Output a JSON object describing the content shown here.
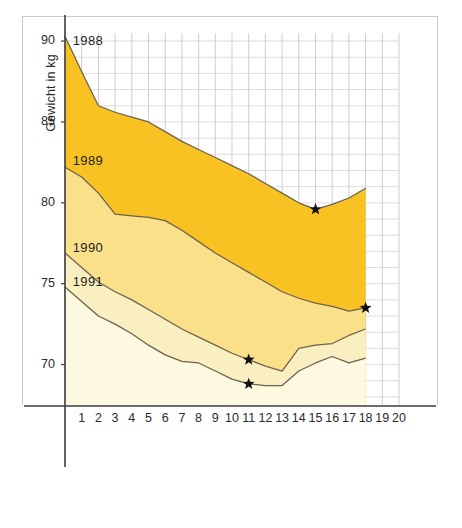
{
  "chart_data": {
    "type": "area",
    "title": "",
    "xlabel": "Fastentage",
    "ylabel": "Gewicht in kg",
    "xlim": [
      0,
      20
    ],
    "ylim": [
      67.5,
      90.5
    ],
    "grid": true,
    "grid_step_x": 1,
    "grid_step_y": 1,
    "legend_position": "inline-labels",
    "x": [
      0,
      1,
      2,
      3,
      4,
      5,
      6,
      7,
      8,
      9,
      10,
      11,
      12,
      13,
      14,
      15,
      16,
      17,
      18
    ],
    "y_ticks": [
      70,
      75,
      80,
      85,
      90
    ],
    "x_ticks": [
      1,
      2,
      3,
      4,
      5,
      6,
      7,
      8,
      9,
      10,
      11,
      12,
      13,
      14,
      15,
      16,
      17,
      18,
      19,
      20
    ],
    "series": [
      {
        "name": "1988",
        "color": "#F8C322",
        "label_x": 0.35,
        "label_y": 90.0,
        "values": [
          90.3,
          88.1,
          86.0,
          85.6,
          85.3,
          85.0,
          84.4,
          83.8,
          83.3,
          82.8,
          82.3,
          81.8,
          81.2,
          80.6,
          80.0,
          79.6,
          79.9,
          80.3,
          80.9
        ],
        "marker": {
          "x": 15,
          "y": 79.6,
          "shape": "star"
        }
      },
      {
        "name": "1989",
        "color": "#FBE08A",
        "label_x": 0.35,
        "label_y": 82.6,
        "values": [
          82.2,
          81.6,
          80.6,
          79.3,
          79.2,
          79.1,
          78.9,
          78.3,
          77.6,
          76.9,
          76.3,
          75.7,
          75.1,
          74.5,
          74.1,
          73.8,
          73.6,
          73.3,
          73.5
        ],
        "marker": {
          "x": 18,
          "y": 73.5,
          "shape": "star"
        }
      },
      {
        "name": "1990",
        "color": "#FAEFC0",
        "label_x": 0.35,
        "label_y": 77.2,
        "values": [
          76.9,
          76.0,
          75.1,
          74.5,
          74.0,
          73.4,
          72.8,
          72.2,
          71.7,
          71.2,
          70.7,
          70.3,
          69.9,
          69.6,
          71.0,
          71.2,
          71.3,
          71.8,
          72.2
        ],
        "marker": {
          "x": 11,
          "y": 70.3,
          "shape": "star"
        }
      },
      {
        "name": "1991",
        "color": "#FDF8E0",
        "label_x": 0.35,
        "label_y": 75.1,
        "values": [
          74.8,
          73.9,
          73.0,
          72.5,
          71.9,
          71.2,
          70.6,
          70.2,
          70.1,
          69.6,
          69.1,
          68.8,
          68.7,
          68.7,
          69.6,
          70.1,
          70.5,
          70.1,
          70.4
        ],
        "marker": {
          "x": 11,
          "y": 68.8,
          "shape": "star"
        }
      }
    ]
  },
  "axes": {
    "y_title": "Gewicht in kg",
    "x_title": "Fastentage"
  }
}
